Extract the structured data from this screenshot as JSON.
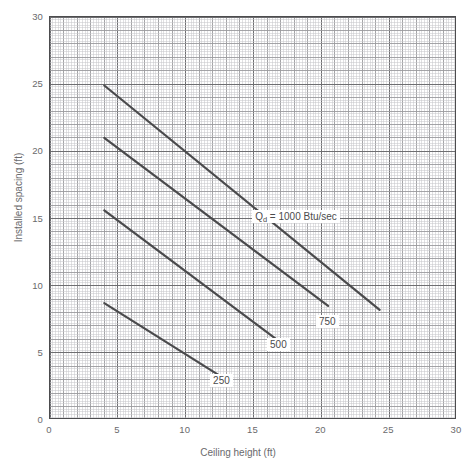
{
  "chart_data": {
    "type": "line",
    "title": "",
    "xlabel": "Ceiling height (ft)",
    "ylabel": "Installed spacing (ft)",
    "xlim": [
      0,
      30
    ],
    "ylim": [
      0,
      30
    ],
    "xticks": [
      0,
      5,
      10,
      15,
      20,
      25,
      30
    ],
    "yticks": [
      0,
      5,
      10,
      15,
      20,
      25,
      30
    ],
    "xtick_labels": [
      "0",
      "5",
      "10",
      "15",
      "20",
      "25",
      "30"
    ],
    "ytick_labels": [
      "0",
      "5",
      "10",
      "15",
      "20",
      "25",
      "30"
    ],
    "grid": true,
    "grid_minor_step": 0.2,
    "grid_major_step": 1,
    "grid_emphasis_step": 5,
    "legend": "inline-labels",
    "line_color": "#4a4a4c",
    "grid_minor_color": "#c9c9cc",
    "grid_major_color": "#9a9a9d",
    "grid_emphasis_color": "#6e6e71",
    "frame_color": "#4c4c4e",
    "text_color": "#6a6a6c",
    "series": [
      {
        "name": "1000",
        "label": "Qd = 1000 Btu/sec",
        "label_text": "Q",
        "label_sub": "d",
        "label_rest": " = 1000 Btu/sec",
        "label_x": 14.9,
        "label_y": 15.1,
        "x": [
          4.0,
          24.3
        ],
        "values": [
          24.9,
          8.2
        ]
      },
      {
        "name": "750",
        "label": "750",
        "label_x": 19.6,
        "label_y": 7.3,
        "x": [
          4.0,
          20.5
        ],
        "values": [
          21.0,
          8.5
        ]
      },
      {
        "name": "500",
        "label": "500",
        "label_x": 16.0,
        "label_y": 5.6,
        "x": [
          4.0,
          16.7
        ],
        "values": [
          15.6,
          6.0
        ]
      },
      {
        "name": "250",
        "label": "250",
        "label_x": 11.8,
        "label_y": 2.9,
        "x": [
          4.0,
          12.5
        ],
        "values": [
          8.7,
          3.3
        ]
      }
    ]
  },
  "caption": {
    "text": ""
  }
}
